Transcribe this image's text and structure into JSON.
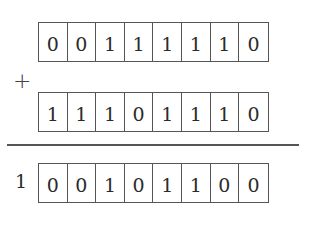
{
  "operator": "+",
  "addend_1": [
    "0",
    "0",
    "1",
    "1",
    "1",
    "1",
    "1",
    "0"
  ],
  "addend_2": [
    "1",
    "1",
    "1",
    "0",
    "1",
    "1",
    "1",
    "0"
  ],
  "result_overflow": "1",
  "result": [
    "0",
    "0",
    "1",
    "0",
    "1",
    "1",
    "0",
    "0"
  ],
  "colors": {
    "ink": "#2b2b2b",
    "border": "#555555",
    "background": "#ffffff"
  }
}
